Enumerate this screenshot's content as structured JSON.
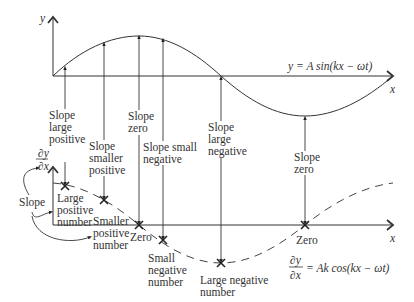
{
  "upper_graph": {
    "y_axis_label": "y",
    "x_axis_label": "x",
    "equation": "y = A sin(kx − ωt)",
    "annotations": [
      {
        "id": "a1",
        "text": "Slope\nlarge\npositive"
      },
      {
        "id": "a2",
        "text": "Slope\nsmaller\npositive"
      },
      {
        "id": "a3",
        "text": "Slope\nzero"
      },
      {
        "id": "a4",
        "text": "Slope small\nnegative"
      },
      {
        "id": "a5",
        "text": "Slope\nlarge\nnegative"
      },
      {
        "id": "a6",
        "text": "Slope\nzero"
      }
    ]
  },
  "lower_graph": {
    "y_axis_label_num": "∂y",
    "y_axis_label_den": "∂x",
    "x_axis_label": "x",
    "equation_num": "∂y",
    "equation_den": "∂x",
    "equation_rhs": "= Ak cos(kx − ωt)",
    "slope_label": "Slope",
    "points": [
      {
        "id": "p1",
        "text": "Large\npositive\nnumber"
      },
      {
        "id": "p2",
        "text": "Smaller\npositive\nnumber"
      },
      {
        "id": "p3",
        "text": "Zero"
      },
      {
        "id": "p4",
        "text": "Small\nnegative\nnumber"
      },
      {
        "id": "p5",
        "text": "Large negative\nnumber"
      },
      {
        "id": "p6",
        "text": "Zero"
      }
    ]
  }
}
